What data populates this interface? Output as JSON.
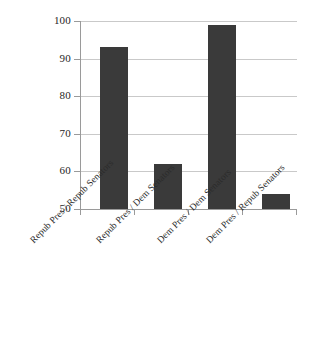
{
  "chart_data": {
    "type": "bar",
    "title": "",
    "subtitle": "",
    "xlabel": "",
    "ylabel": "",
    "ylim": [
      50,
      100
    ],
    "yticks": [
      50,
      60,
      70,
      80,
      90,
      100
    ],
    "ytick_labels": [
      "50",
      "60",
      "70",
      "80",
      "90",
      "100"
    ],
    "grid": true,
    "legend": false,
    "legend_position": "none",
    "categories": [
      "Repub Pres / Repub Senators",
      "Repub Pres / Dem Senators",
      "Dem Pres / Dem Senators",
      "Dem Pres / Repub Senators"
    ],
    "values": [
      93,
      62,
      99,
      54
    ],
    "series": [
      {
        "name": "",
        "values": [
          93,
          62,
          99,
          54
        ]
      }
    ],
    "bar_color": "#3a3a3a",
    "grid_color": "#c9c9c9",
    "axis_color": "#9a9a9a",
    "background_color": "#ffffff",
    "xlabel_rotation": -45
  }
}
